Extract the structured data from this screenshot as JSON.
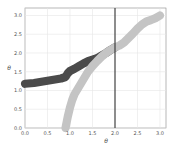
{
  "chart_data": {
    "type": "line",
    "title": "",
    "xlabel": "θ",
    "ylabel": "θ",
    "xlim": [
      0.0,
      3.1
    ],
    "ylim": [
      0.0,
      3.2
    ],
    "grid": true,
    "legend": null,
    "x_ticks": [
      "0.0",
      "0.5",
      "1.0",
      "1.5",
      "2.0",
      "2.5",
      "3.0"
    ],
    "y_ticks": [
      "0.0",
      "0.5",
      "1.0",
      "1.5",
      "2.0",
      "2.5",
      "3.0"
    ],
    "vertical_line": {
      "x": 2.0,
      "color": "#222222"
    },
    "series": [
      {
        "name": "dark band",
        "color": "#4a4a4a",
        "band_width": 0.22,
        "x": [
          0.0,
          0.2,
          0.4,
          0.6,
          0.8,
          0.9,
          0.95,
          1.0,
          1.1,
          1.2,
          1.3,
          1.4,
          1.5,
          1.6,
          1.7,
          1.8,
          1.9,
          2.0
        ],
        "y": [
          1.18,
          1.2,
          1.24,
          1.28,
          1.32,
          1.36,
          1.46,
          1.52,
          1.58,
          1.65,
          1.72,
          1.78,
          1.82,
          1.86,
          1.93,
          2.0,
          2.08,
          2.15
        ]
      },
      {
        "name": "light band",
        "color": "#c4c4c4",
        "band_width": 0.22,
        "x": [
          0.9,
          0.95,
          1.0,
          1.05,
          1.1,
          1.2,
          1.3,
          1.4,
          1.5,
          1.6,
          1.7,
          1.8,
          1.9,
          2.0,
          2.1,
          2.2,
          2.3,
          2.4,
          2.5,
          2.6,
          2.7,
          2.8,
          2.9,
          3.0
        ],
        "y": [
          0.0,
          0.3,
          0.55,
          0.75,
          0.9,
          1.1,
          1.3,
          1.5,
          1.65,
          1.78,
          1.9,
          2.0,
          2.08,
          2.15,
          2.2,
          2.28,
          2.4,
          2.52,
          2.65,
          2.76,
          2.84,
          2.88,
          2.93,
          3.0
        ]
      }
    ]
  }
}
